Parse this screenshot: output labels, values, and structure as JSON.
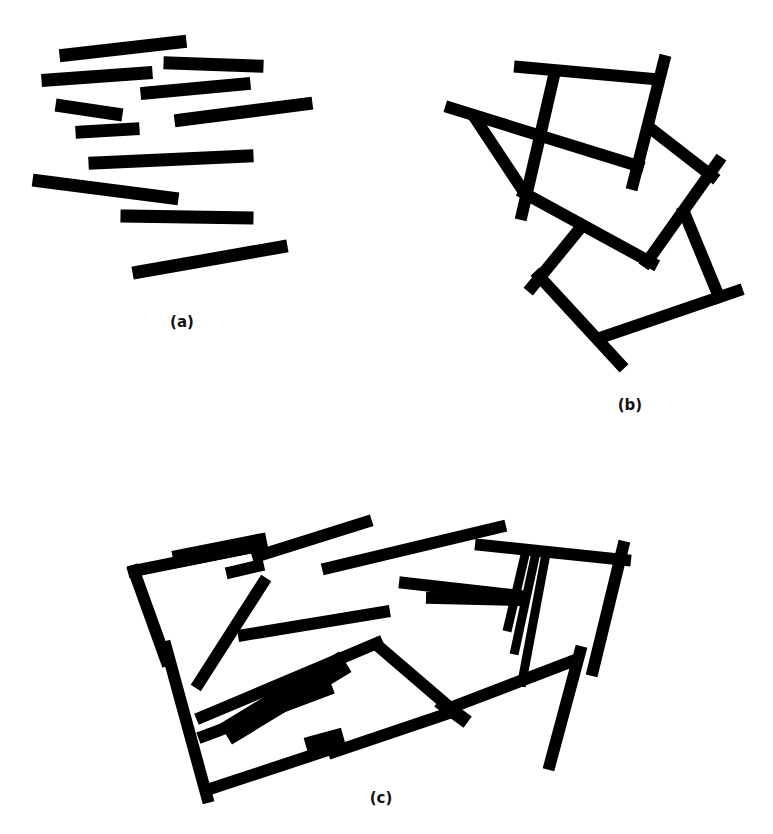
{
  "figure": {
    "width": 773,
    "height": 834,
    "background": "#ffffff",
    "bar_color": "#000000",
    "panels": [
      {
        "id": "a",
        "label": "(a)",
        "label_pos": [
          182,
          327
        ],
        "description": "Randomly scattered, disconnected bars",
        "bars": [
          {
            "x1": 66,
            "y1": 55,
            "x2": 180,
            "y2": 42,
            "w": 13
          },
          {
            "x1": 48,
            "y1": 80,
            "x2": 146,
            "y2": 73,
            "w": 13
          },
          {
            "x1": 170,
            "y1": 63,
            "x2": 257,
            "y2": 66,
            "w": 13
          },
          {
            "x1": 147,
            "y1": 93,
            "x2": 244,
            "y2": 84,
            "w": 13
          },
          {
            "x1": 62,
            "y1": 106,
            "x2": 116,
            "y2": 114,
            "w": 13
          },
          {
            "x1": 181,
            "y1": 120,
            "x2": 306,
            "y2": 104,
            "w": 13
          },
          {
            "x1": 82,
            "y1": 132,
            "x2": 133,
            "y2": 129,
            "w": 13
          },
          {
            "x1": 95,
            "y1": 163,
            "x2": 247,
            "y2": 156,
            "w": 13
          },
          {
            "x1": 39,
            "y1": 181,
            "x2": 172,
            "y2": 198,
            "w": 13
          },
          {
            "x1": 127,
            "y1": 216,
            "x2": 247,
            "y2": 218,
            "w": 13
          },
          {
            "x1": 139,
            "y1": 272,
            "x2": 281,
            "y2": 247,
            "w": 13
          }
        ]
      },
      {
        "id": "b",
        "label": "(b)",
        "label_pos": [
          630,
          410
        ],
        "description": "Bars joined into connected closed structures",
        "bars": [
          {
            "x1": 520,
            "y1": 67,
            "x2": 653,
            "y2": 79,
            "w": 12
          },
          {
            "x1": 664,
            "y1": 61,
            "x2": 633,
            "y2": 184,
            "w": 12
          },
          {
            "x1": 553,
            "y1": 80,
            "x2": 522,
            "y2": 214,
            "w": 12
          },
          {
            "x1": 451,
            "y1": 108,
            "x2": 638,
            "y2": 166,
            "w": 12
          },
          {
            "x1": 475,
            "y1": 118,
            "x2": 528,
            "y2": 198,
            "w": 12
          },
          {
            "x1": 524,
            "y1": 193,
            "x2": 652,
            "y2": 263,
            "w": 12
          },
          {
            "x1": 650,
            "y1": 128,
            "x2": 712,
            "y2": 176,
            "w": 12
          },
          {
            "x1": 718,
            "y1": 162,
            "x2": 647,
            "y2": 262,
            "w": 12
          },
          {
            "x1": 582,
            "y1": 226,
            "x2": 532,
            "y2": 287,
            "w": 12
          },
          {
            "x1": 539,
            "y1": 276,
            "x2": 620,
            "y2": 364,
            "w": 12
          },
          {
            "x1": 600,
            "y1": 338,
            "x2": 737,
            "y2": 291,
            "w": 12
          },
          {
            "x1": 684,
            "y1": 212,
            "x2": 719,
            "y2": 297,
            "w": 12
          }
        ]
      },
      {
        "id": "c",
        "label": "(c)",
        "label_pos": [
          381,
          803
        ],
        "description": "Dense cluster of overlapping bars forming a boundary",
        "bars": [
          {
            "x1": 134,
            "y1": 571,
            "x2": 258,
            "y2": 546,
            "w": 12
          },
          {
            "x1": 182,
            "y1": 558,
            "x2": 258,
            "y2": 543,
            "w": 18
          },
          {
            "x1": 232,
            "y1": 572,
            "x2": 258,
            "y2": 566,
            "w": 12
          },
          {
            "x1": 258,
            "y1": 556,
            "x2": 366,
            "y2": 522,
            "w": 12
          },
          {
            "x1": 328,
            "y1": 568,
            "x2": 500,
            "y2": 527,
            "w": 12
          },
          {
            "x1": 481,
            "y1": 545,
            "x2": 625,
            "y2": 560,
            "w": 12
          },
          {
            "x1": 134,
            "y1": 571,
            "x2": 166,
            "y2": 660,
            "w": 12
          },
          {
            "x1": 166,
            "y1": 647,
            "x2": 207,
            "y2": 797,
            "w": 12
          },
          {
            "x1": 263,
            "y1": 583,
            "x2": 199,
            "y2": 683,
            "w": 12
          },
          {
            "x1": 244,
            "y1": 635,
            "x2": 384,
            "y2": 612,
            "w": 12
          },
          {
            "x1": 202,
            "y1": 717,
            "x2": 377,
            "y2": 643,
            "w": 12
          },
          {
            "x1": 236,
            "y1": 728,
            "x2": 335,
            "y2": 668,
            "w": 24
          },
          {
            "x1": 251,
            "y1": 717,
            "x2": 325,
            "y2": 675,
            "w": 18
          },
          {
            "x1": 377,
            "y1": 645,
            "x2": 455,
            "y2": 712,
            "w": 12
          },
          {
            "x1": 204,
            "y1": 736,
            "x2": 327,
            "y2": 690,
            "w": 12
          },
          {
            "x1": 207,
            "y1": 790,
            "x2": 334,
            "y2": 748,
            "w": 12
          },
          {
            "x1": 316,
            "y1": 745,
            "x2": 334,
            "y2": 740,
            "w": 20
          },
          {
            "x1": 334,
            "y1": 752,
            "x2": 455,
            "y2": 711,
            "w": 12
          },
          {
            "x1": 455,
            "y1": 706,
            "x2": 570,
            "y2": 662,
            "w": 12
          },
          {
            "x1": 444,
            "y1": 705,
            "x2": 462,
            "y2": 718,
            "w": 14
          },
          {
            "x1": 405,
            "y1": 583,
            "x2": 520,
            "y2": 596,
            "w": 12
          },
          {
            "x1": 432,
            "y1": 598,
            "x2": 520,
            "y2": 600,
            "w": 12
          },
          {
            "x1": 525,
            "y1": 555,
            "x2": 508,
            "y2": 627,
            "w": 9
          },
          {
            "x1": 535,
            "y1": 557,
            "x2": 515,
            "y2": 650,
            "w": 9
          },
          {
            "x1": 545,
            "y1": 559,
            "x2": 522,
            "y2": 682,
            "w": 9
          },
          {
            "x1": 623,
            "y1": 547,
            "x2": 593,
            "y2": 670,
            "w": 12
          },
          {
            "x1": 580,
            "y1": 652,
            "x2": 550,
            "y2": 764,
            "w": 12
          }
        ]
      }
    ]
  }
}
